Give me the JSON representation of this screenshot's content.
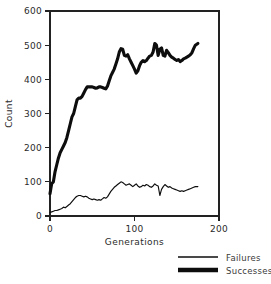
{
  "chart_data": {
    "type": "line",
    "title": "",
    "xlabel": "Generations",
    "ylabel": "Count",
    "xlim": [
      0,
      200
    ],
    "ylim": [
      0,
      600
    ],
    "xticks": [
      0,
      100,
      200
    ],
    "xtick_labels": [
      "0",
      "100",
      "200"
    ],
    "yticks": [
      0,
      100,
      200,
      300,
      400,
      500,
      600
    ],
    "ytick_labels": [
      "0",
      "100",
      "200",
      "300",
      "400",
      "500",
      "600"
    ],
    "grid": false,
    "legend_position": "below-right",
    "series": [
      {
        "name": "Failures",
        "style": "thin-line",
        "color": "#0d0d0d",
        "x": [
          0,
          2,
          4,
          6,
          8,
          10,
          12,
          14,
          16,
          18,
          20,
          22,
          24,
          26,
          28,
          30,
          32,
          34,
          36,
          38,
          40,
          42,
          44,
          46,
          48,
          50,
          52,
          54,
          56,
          58,
          60,
          62,
          64,
          66,
          68,
          70,
          72,
          74,
          76,
          78,
          80,
          82,
          84,
          86,
          88,
          90,
          92,
          94,
          96,
          98,
          100,
          102,
          104,
          106,
          108,
          110,
          112,
          114,
          116,
          118,
          120,
          122,
          124,
          126,
          128,
          130,
          132,
          134,
          136,
          138,
          140,
          142,
          144,
          146,
          148,
          150,
          152,
          154,
          156,
          158,
          160,
          162,
          164,
          166,
          168,
          170,
          172,
          175
        ],
        "y": [
          10,
          12,
          14,
          16,
          16,
          18,
          20,
          22,
          26,
          24,
          28,
          32,
          36,
          42,
          48,
          54,
          58,
          60,
          60,
          58,
          56,
          58,
          56,
          52,
          50,
          48,
          50,
          48,
          46,
          48,
          46,
          50,
          54,
          52,
          56,
          64,
          72,
          78,
          84,
          88,
          92,
          96,
          100,
          98,
          94,
          90,
          92,
          94,
          90,
          86,
          90,
          94,
          88,
          84,
          86,
          90,
          88,
          92,
          90,
          86,
          84,
          88,
          94,
          90,
          88,
          60,
          78,
          86,
          92,
          88,
          84,
          86,
          82,
          80,
          78,
          76,
          74,
          72,
          74,
          72,
          74,
          76,
          78,
          80,
          82,
          84,
          86,
          86
        ]
      },
      {
        "name": "Successes",
        "style": "thick-line",
        "color": "#0d0d0d",
        "x": [
          0,
          2,
          4,
          6,
          8,
          10,
          12,
          14,
          16,
          18,
          20,
          22,
          24,
          26,
          28,
          30,
          32,
          34,
          36,
          38,
          40,
          42,
          44,
          46,
          48,
          50,
          52,
          54,
          56,
          58,
          60,
          62,
          64,
          66,
          68,
          70,
          72,
          74,
          76,
          78,
          80,
          82,
          84,
          86,
          88,
          90,
          92,
          94,
          96,
          98,
          100,
          102,
          104,
          106,
          108,
          110,
          112,
          114,
          116,
          118,
          120,
          122,
          124,
          126,
          128,
          130,
          132,
          134,
          136,
          138,
          140,
          142,
          144,
          146,
          148,
          150,
          152,
          154,
          156,
          158,
          160,
          162,
          164,
          166,
          168,
          170,
          172,
          175
        ],
        "y": [
          65,
          95,
          100,
          130,
          150,
          170,
          185,
          195,
          205,
          215,
          230,
          250,
          270,
          290,
          300,
          320,
          340,
          345,
          345,
          350,
          360,
          370,
          378,
          378,
          378,
          378,
          376,
          374,
          375,
          378,
          378,
          376,
          374,
          372,
          380,
          395,
          410,
          420,
          430,
          445,
          460,
          480,
          490,
          488,
          470,
          468,
          472,
          460,
          450,
          440,
          430,
          418,
          425,
          440,
          450,
          455,
          452,
          455,
          462,
          468,
          470,
          480,
          505,
          500,
          470,
          488,
          492,
          470,
          468,
          485,
          478,
          470,
          465,
          462,
          458,
          455,
          458,
          452,
          455,
          460,
          462,
          465,
          468,
          472,
          478,
          490,
          500,
          505
        ]
      }
    ],
    "legend": [
      {
        "label": "Failures",
        "style": "thin-line"
      },
      {
        "label": "Successes",
        "style": "thick-line"
      }
    ]
  }
}
